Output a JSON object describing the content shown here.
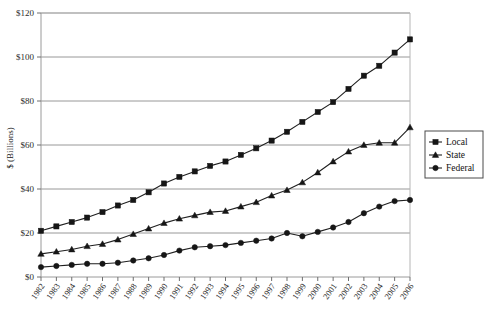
{
  "chart_data": {
    "type": "line",
    "title": "",
    "subtitle": "",
    "xlabel": "",
    "ylabel": "$ (Billions)",
    "ylim": [
      0,
      120
    ],
    "yticks": [
      0,
      20,
      40,
      60,
      80,
      100,
      120
    ],
    "ytick_labels": [
      "$0",
      "$20",
      "$40",
      "$60",
      "$80",
      "$100",
      "$120"
    ],
    "grid": "horizontal",
    "legend_position": "right",
    "x": [
      1982,
      1983,
      1984,
      1985,
      1986,
      1987,
      1988,
      1989,
      1990,
      1991,
      1992,
      1993,
      1994,
      1995,
      1996,
      1997,
      1998,
      1999,
      2000,
      2001,
      2002,
      2003,
      2004,
      2005,
      2006
    ],
    "xtick_labels": [
      "1982",
      "1983",
      "1984",
      "1985",
      "1986",
      "1987",
      "1988",
      "1989",
      "1990",
      "1991",
      "1992",
      "1993",
      "1994",
      "1995",
      "1996",
      "1997",
      "1998",
      "1999",
      "2000",
      "2001",
      "2002",
      "2003",
      "2004",
      "2005",
      "2006"
    ],
    "series": [
      {
        "name": "Local",
        "marker": "square",
        "values": [
          21.0,
          23.0,
          25.0,
          27.0,
          29.5,
          32.5,
          35.0,
          38.5,
          42.5,
          45.5,
          48.0,
          50.5,
          52.5,
          55.5,
          58.5,
          62.0,
          66.0,
          70.5,
          75.0,
          79.5,
          85.5,
          91.5,
          96.0,
          102.0,
          108.0
        ]
      },
      {
        "name": "State",
        "marker": "triangle",
        "values": [
          10.5,
          11.5,
          12.5,
          14.0,
          15.0,
          17.0,
          19.5,
          22.0,
          24.5,
          26.5,
          28.0,
          29.5,
          30.0,
          32.0,
          34.0,
          37.0,
          39.5,
          43.0,
          47.5,
          52.5,
          57.0,
          60.0,
          61.0,
          61.0,
          68.0
        ]
      },
      {
        "name": "Federal",
        "marker": "circle",
        "values": [
          4.5,
          5.0,
          5.5,
          6.0,
          6.0,
          6.5,
          7.5,
          8.5,
          10.0,
          12.0,
          13.5,
          14.0,
          14.5,
          15.5,
          16.5,
          17.5,
          20.0,
          18.5,
          20.5,
          22.5,
          25.0,
          29.0,
          32.0,
          34.5,
          35.0
        ]
      }
    ]
  },
  "legend": {
    "items": [
      {
        "label": "Local"
      },
      {
        "label": "State"
      },
      {
        "label": "Federal"
      }
    ]
  }
}
